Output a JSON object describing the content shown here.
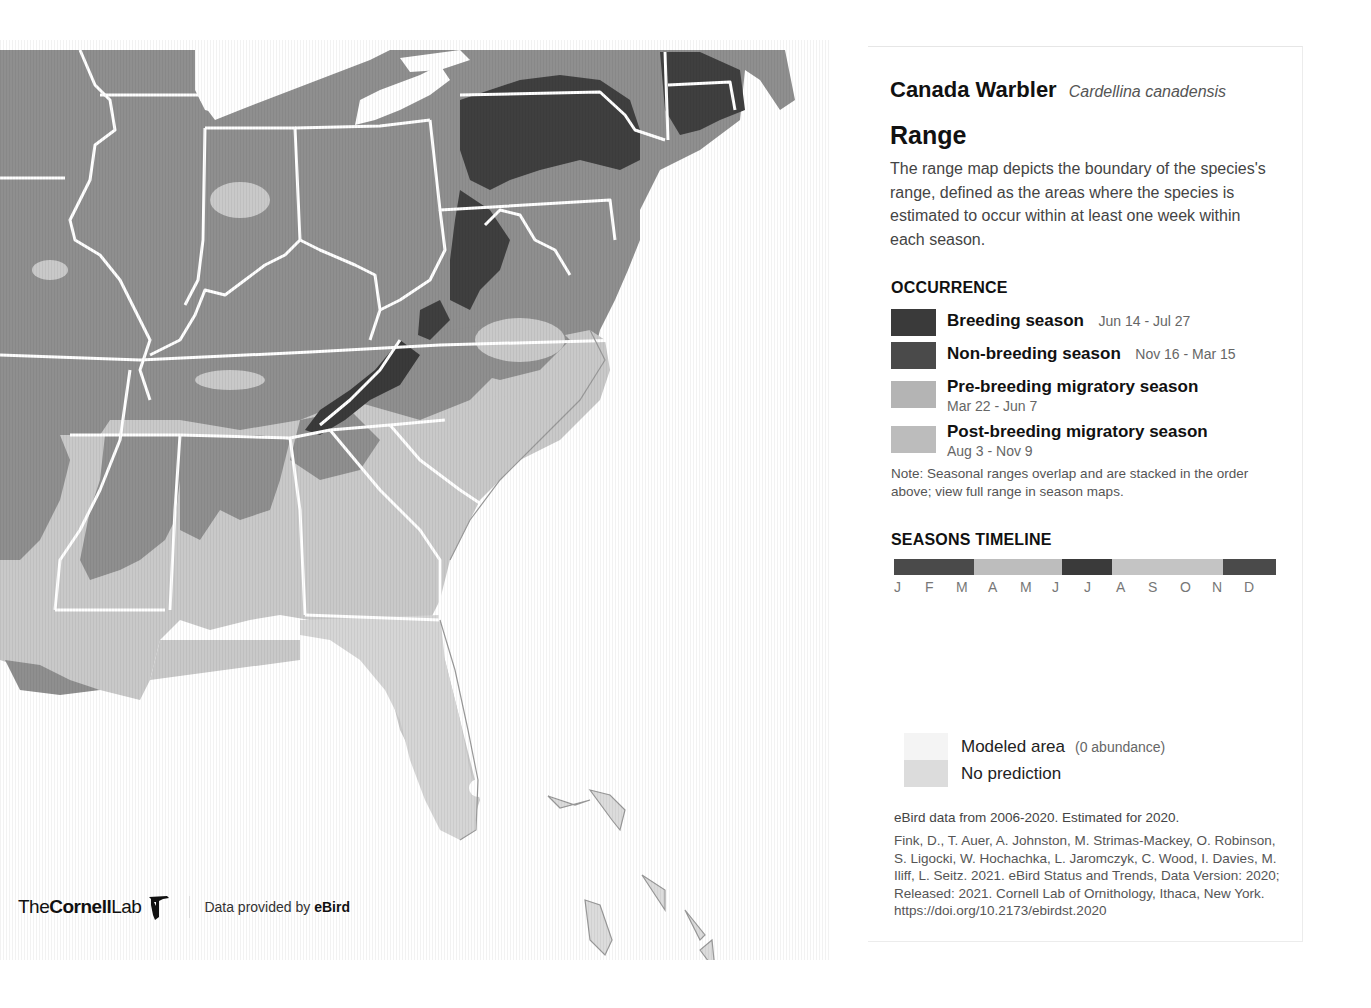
{
  "species": {
    "common_name": "Canada Warbler",
    "scientific_name": "Cardellina canadensis"
  },
  "range": {
    "title": "Range",
    "description": "The range map depicts the boundary of the species's range, defined as the areas where the species is estimated to occur within at least one week within each season."
  },
  "occurrence": {
    "title": "OCCURRENCE",
    "items": [
      {
        "label": "Breeding season",
        "dates": "Jun 14 - Jul 27",
        "color": "#3a3a3a"
      },
      {
        "label": "Non-breeding season",
        "dates": "Nov 16 - Mar 15",
        "color": "#4a4a4a"
      },
      {
        "label": "Pre-breeding migratory season",
        "dates": "Mar 22 - Jun 7",
        "color": "#b4b4b4"
      },
      {
        "label": "Post-breeding migratory season",
        "dates": "Aug 3 - Nov 9",
        "color": "#bcbcbc"
      }
    ],
    "note": "Note: Seasonal ranges overlap and are stacked in the order above; view full range in season maps."
  },
  "timeline": {
    "title": "SEASONS TIMELINE",
    "months": [
      "J",
      "F",
      "M",
      "A",
      "M",
      "J",
      "J",
      "A",
      "S",
      "O",
      "N",
      "D"
    ],
    "segments": [
      {
        "season": "non-breeding",
        "width_pct": 21,
        "color": "#4a4a4a"
      },
      {
        "season": "pre-breeding",
        "width_pct": 23,
        "color": "#bdbdbd"
      },
      {
        "season": "breeding",
        "width_pct": 13,
        "color": "#3a3a3a"
      },
      {
        "season": "post-breeding",
        "width_pct": 29,
        "color": "#c4c4c4"
      },
      {
        "season": "non-breeding",
        "width_pct": 14,
        "color": "#4a4a4a"
      }
    ]
  },
  "extra_legend": {
    "modeled_area": {
      "label": "Modeled area",
      "note": "(0 abundance)",
      "color": "#f4f4f4"
    },
    "no_prediction": {
      "label": "No prediction",
      "color": "#dcdcdc"
    }
  },
  "data_note": "eBird data from 2006-2020. Estimated for 2020.",
  "citation": "Fink, D., T. Auer, A. Johnston, M. Strimas-Mackey, O. Robinson, S. Ligocki, W. Hochachka, L. Jaromczyk, C. Wood, I. Davies, M. Iliff, L. Seitz. 2021. eBird Status and Trends, Data Version: 2020; Released: 2021. Cornell Lab of Ornithology, Ithaca, New York. https://doi.org/10.2173/ebirdst.2020",
  "footer": {
    "logo_the": "The",
    "logo_cornell": "Cornell",
    "logo_lab": "Lab",
    "provided_prefix": "Data provided by",
    "provided_brand": "eBird"
  },
  "map": {
    "region": "Eastern United States",
    "colors": {
      "water": "#ffffff",
      "breeding": "#3d3d3d",
      "migration": "#8e8e8e",
      "non_breeding_light": "#c9c9c9",
      "modeled": "#dadada",
      "borders": "#ffffff"
    }
  }
}
